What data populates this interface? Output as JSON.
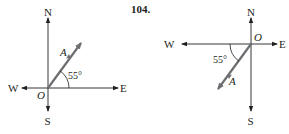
{
  "figures": [
    {
      "number": "",
      "north": "N",
      "south": "S",
      "east": "E",
      "west": "W",
      "origin": "O",
      "vector": "A",
      "angle": "55°",
      "vector_color": "#6d6e71"
    },
    {
      "number": "104.",
      "north": "N",
      "south": "S",
      "east": "E",
      "west": "W",
      "origin": "O",
      "vector": "A",
      "angle": "55°",
      "vector_color": "#6d6e71"
    }
  ],
  "colors": {
    "axis": "#231f20",
    "vector": "#6d6e71",
    "background": "#ffffff"
  }
}
